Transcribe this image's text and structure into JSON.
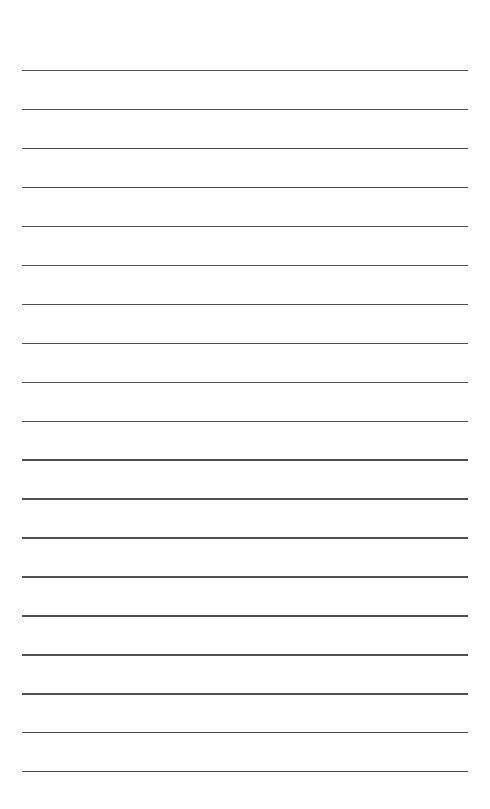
{
  "page": {
    "type": "lined-paper",
    "background_color": "#ffffff",
    "line_color": "#505050",
    "line_count": 19,
    "line_left_px": 22,
    "line_right_px": 468,
    "first_line_y_px": 70,
    "last_line_y_px": 771,
    "lines": [
      {
        "index": 1,
        "text": ""
      },
      {
        "index": 2,
        "text": ""
      },
      {
        "index": 3,
        "text": ""
      },
      {
        "index": 4,
        "text": ""
      },
      {
        "index": 5,
        "text": ""
      },
      {
        "index": 6,
        "text": ""
      },
      {
        "index": 7,
        "text": ""
      },
      {
        "index": 8,
        "text": ""
      },
      {
        "index": 9,
        "text": ""
      },
      {
        "index": 10,
        "text": ""
      },
      {
        "index": 11,
        "text": ""
      },
      {
        "index": 12,
        "text": ""
      },
      {
        "index": 13,
        "text": ""
      },
      {
        "index": 14,
        "text": ""
      },
      {
        "index": 15,
        "text": ""
      },
      {
        "index": 16,
        "text": ""
      },
      {
        "index": 17,
        "text": ""
      },
      {
        "index": 18,
        "text": ""
      },
      {
        "index": 19,
        "text": ""
      }
    ]
  }
}
